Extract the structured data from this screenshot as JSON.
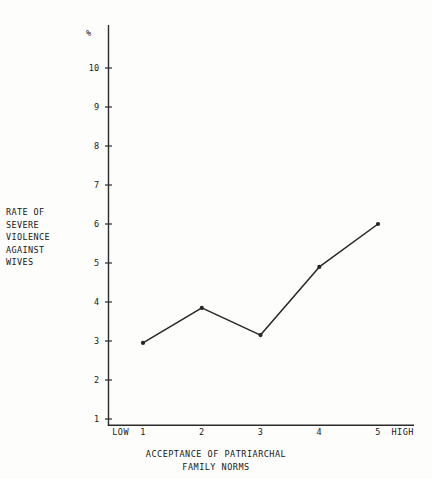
{
  "chart_data": {
    "type": "line",
    "title": "",
    "subtitle": "",
    "xlabel": "ACCEPTANCE OF PATRIARCHAL FAMILY NORMS",
    "ylabel": "RATE OF SEVERE VIOLENCE AGAINST WIVES",
    "unit_symbol": "%",
    "categories": [
      "1",
      "2",
      "3",
      "4",
      "5"
    ],
    "x": [
      1,
      2,
      3,
      4,
      5
    ],
    "values": [
      2.95,
      3.85,
      3.15,
      4.9,
      6.0
    ],
    "series": [
      {
        "name": "Rate of severe violence against wives",
        "values": [
          2.95,
          3.85,
          3.15,
          4.9,
          6.0
        ]
      }
    ],
    "xlim": [
      0.5,
      5.5
    ],
    "ylim": [
      1,
      10
    ],
    "yticks": [
      1,
      2,
      3,
      4,
      5,
      6,
      7,
      8,
      9,
      10
    ],
    "ytick_labels": [
      "1",
      "2",
      "3",
      "4",
      "5",
      "6",
      "7",
      "8",
      "9",
      "10"
    ],
    "xtick_labels": [
      "1",
      "2",
      "3",
      "4",
      "5"
    ],
    "x_low_label": "LOW",
    "x_high_label": "HIGH",
    "grid": false,
    "legend": false,
    "legend_position": "none",
    "markers": true,
    "line_color": "#262626"
  },
  "axes": {
    "y_caption_lines": [
      "RATE OF",
      "SEVERE",
      "VIOLENCE",
      "AGAINST",
      "WIVES"
    ],
    "percent_symbol": "%",
    "y_ticks": [
      {
        "label": "10",
        "value": 10
      },
      {
        "label": "9",
        "value": 9
      },
      {
        "label": "8",
        "value": 8
      },
      {
        "label": "7",
        "value": 7
      },
      {
        "label": "6",
        "value": 6
      },
      {
        "label": "5",
        "value": 5
      },
      {
        "label": "4",
        "value": 4
      },
      {
        "label": "3",
        "value": 3
      },
      {
        "label": "2",
        "value": 2
      },
      {
        "label": "1",
        "value": 1
      }
    ],
    "x_ticks": [
      {
        "label": "LOW",
        "value": 0.62,
        "kind": "anchor"
      },
      {
        "label": "1",
        "value": 1,
        "kind": "tick"
      },
      {
        "label": "2",
        "value": 2,
        "kind": "tick"
      },
      {
        "label": "3",
        "value": 3,
        "kind": "tick"
      },
      {
        "label": "4",
        "value": 4,
        "kind": "tick"
      },
      {
        "label": "5",
        "value": 5,
        "kind": "tick"
      },
      {
        "label": "HIGH",
        "value": 5.42,
        "kind": "anchor"
      }
    ],
    "x_title_lines": [
      "ACCEPTANCE OF PATRIARCHAL",
      "FAMILY NORMS"
    ]
  },
  "colors": {
    "ink": "#18181a",
    "line": "#262626",
    "paper": "#fdfdfb"
  }
}
